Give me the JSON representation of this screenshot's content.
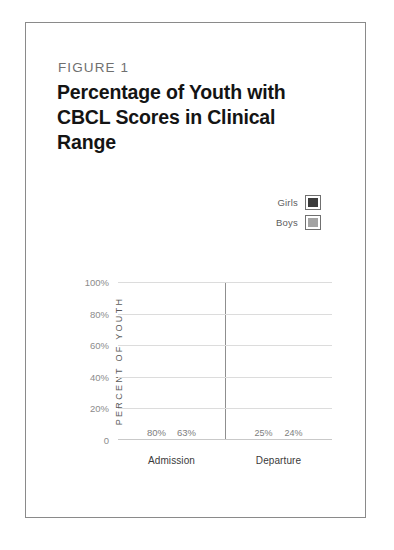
{
  "figure": {
    "label": "FIGURE 1",
    "title": "Percentage of Youth with CBCL Scores in Clinical Range"
  },
  "legend": {
    "position": "top-right",
    "entries": [
      {
        "label": "Girls",
        "color": "#3c3c3c"
      },
      {
        "label": "Boys",
        "color": "#a3a3a3"
      }
    ]
  },
  "chart_data": {
    "type": "bar",
    "title": "Percentage of Youth with CBCL Scores in Clinical Range",
    "xlabel": "",
    "ylabel": "PERCENT OF YOUTH",
    "categories": [
      "Admission",
      "Departure"
    ],
    "series": [
      {
        "name": "Girls",
        "color": "#3c3c3c",
        "values": [
          80,
          25
        ],
        "labels": [
          "80%",
          "63%"
        ]
      },
      {
        "name": "Boys",
        "color": "#a3a3a3",
        "values": [
          63,
          24
        ],
        "labels": [
          "25%",
          "24%"
        ]
      }
    ],
    "points": [
      {
        "category": "Admission",
        "series": "Girls",
        "value": 80,
        "label": "80%"
      },
      {
        "category": "Admission",
        "series": "Boys",
        "value": 63,
        "label": "63%"
      },
      {
        "category": "Departure",
        "series": "Girls",
        "value": 25,
        "label": "25%"
      },
      {
        "category": "Departure",
        "series": "Boys",
        "value": 24,
        "label": "24%"
      }
    ],
    "ylim": [
      0,
      100
    ],
    "yticks": [
      "100%",
      "80%",
      "60%",
      "40%",
      "20%",
      "0"
    ],
    "ytick_values": [
      100,
      80,
      60,
      40,
      20,
      0
    ],
    "grid": true,
    "legend_position": "top-right"
  }
}
